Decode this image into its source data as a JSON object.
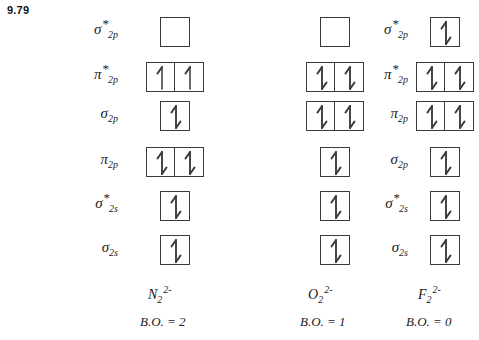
{
  "problem": {
    "number": "9.79"
  },
  "diagram": {
    "type": "molecular-orbital-energy-diagram",
    "ink_color": "#3a3a3a",
    "columns": [
      {
        "id": "col-n2",
        "species_symbol": "N",
        "species_subscript": "2",
        "species_superscript": "2-",
        "species_full": "N2^2-",
        "bond_order_text": "B.O. = 2",
        "bond_order_value": 2,
        "label_side": "left",
        "levels": [
          {
            "name": "sigma-star-2p",
            "greek": "σ",
            "sub": "2p",
            "star": true,
            "boxes": 1,
            "electrons": [
              0
            ]
          },
          {
            "name": "pi-star-2p",
            "greek": "π",
            "sub": "2p",
            "star": true,
            "boxes": 2,
            "electrons": [
              1,
              1
            ]
          },
          {
            "name": "sigma-2p",
            "greek": "σ",
            "sub": "2p",
            "star": false,
            "boxes": 1,
            "electrons": [
              2
            ]
          },
          {
            "name": "pi-2p",
            "greek": "π",
            "sub": "2p",
            "star": false,
            "boxes": 2,
            "electrons": [
              2,
              2
            ]
          },
          {
            "name": "sigma-star-2s",
            "greek": "σ",
            "sub": "2s",
            "star": true,
            "boxes": 1,
            "electrons": [
              2
            ]
          },
          {
            "name": "sigma-2s",
            "greek": "σ",
            "sub": "2s",
            "star": false,
            "boxes": 1,
            "electrons": [
              2
            ]
          }
        ]
      },
      {
        "id": "col-o2",
        "species_symbol": "O",
        "species_subscript": "2",
        "species_superscript": "2-",
        "species_full": "O2^2-",
        "bond_order_text": "B.O. = 1",
        "bond_order_value": 1,
        "label_side": "right",
        "levels": [
          {
            "name": "sigma-star-2p",
            "greek": "σ",
            "sub": "2p",
            "star": true,
            "boxes": 1,
            "electrons": [
              0
            ]
          },
          {
            "name": "pi-star-2p",
            "greek": "π",
            "sub": "2p",
            "star": true,
            "boxes": 2,
            "electrons": [
              2,
              2
            ]
          },
          {
            "name": "pi-2p",
            "greek": "π",
            "sub": "2p",
            "star": false,
            "boxes": 2,
            "electrons": [
              2,
              2
            ]
          },
          {
            "name": "sigma-2p",
            "greek": "σ",
            "sub": "2p",
            "star": false,
            "boxes": 1,
            "electrons": [
              2
            ]
          },
          {
            "name": "sigma-star-2s",
            "greek": "σ",
            "sub": "2s",
            "star": true,
            "boxes": 1,
            "electrons": [
              2
            ]
          },
          {
            "name": "sigma-2s",
            "greek": "σ",
            "sub": "2s",
            "star": false,
            "boxes": 1,
            "electrons": [
              2
            ]
          }
        ]
      },
      {
        "id": "col-f2",
        "species_symbol": "F",
        "species_subscript": "2",
        "species_superscript": "2-",
        "species_full": "F2^2-",
        "bond_order_text": "B.O. = 0",
        "bond_order_value": 0,
        "label_side": "shared-center",
        "levels": [
          {
            "name": "sigma-star-2p",
            "greek": "σ",
            "sub": "2p",
            "star": true,
            "boxes": 1,
            "electrons": [
              2
            ]
          },
          {
            "name": "pi-star-2p",
            "greek": "π",
            "sub": "2p",
            "star": true,
            "boxes": 2,
            "electrons": [
              2,
              2
            ]
          },
          {
            "name": "pi-2p",
            "greek": "π",
            "sub": "2p",
            "star": false,
            "boxes": 2,
            "electrons": [
              2,
              2
            ]
          },
          {
            "name": "sigma-2p",
            "greek": "σ",
            "sub": "2p",
            "star": false,
            "boxes": 1,
            "electrons": [
              2
            ]
          },
          {
            "name": "sigma-star-2s",
            "greek": "σ",
            "sub": "2s",
            "star": true,
            "boxes": 1,
            "electrons": [
              2
            ]
          },
          {
            "name": "sigma-2s",
            "greek": "σ",
            "sub": "2s",
            "star": false,
            "boxes": 1,
            "electrons": [
              2
            ]
          }
        ]
      }
    ],
    "left_labels": [
      {
        "name": "sigma-star-2p",
        "greek": "σ",
        "sub": "2p",
        "star": true
      },
      {
        "name": "pi-star-2p",
        "greek": "π",
        "sub": "2p",
        "star": true
      },
      {
        "name": "sigma-2p",
        "greek": "σ",
        "sub": "2p",
        "star": false
      },
      {
        "name": "pi-2p",
        "greek": "π",
        "sub": "2p",
        "star": false
      },
      {
        "name": "sigma-star-2s",
        "greek": "σ",
        "sub": "2s",
        "star": true
      },
      {
        "name": "sigma-2s",
        "greek": "σ",
        "sub": "2s",
        "star": false
      }
    ],
    "center_labels": [
      {
        "name": "sigma-star-2p",
        "greek": "σ",
        "sub": "2p",
        "star": true
      },
      {
        "name": "pi-star-2p",
        "greek": "π",
        "sub": "2p",
        "star": true
      },
      {
        "name": "pi-2p",
        "greek": "π",
        "sub": "2p",
        "star": false
      },
      {
        "name": "sigma-2p",
        "greek": "σ",
        "sub": "2p",
        "star": false
      },
      {
        "name": "sigma-star-2s",
        "greek": "σ",
        "sub": "2s",
        "star": true
      },
      {
        "name": "sigma-2s",
        "greek": "σ",
        "sub": "2s",
        "star": false
      }
    ]
  }
}
